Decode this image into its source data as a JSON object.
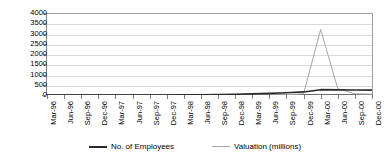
{
  "chart_data": {
    "type": "line",
    "title": "",
    "xlabel": "",
    "ylabel": "",
    "ylim": [
      0,
      4000
    ],
    "ytick_step": 500,
    "yticks": [
      "0",
      "500",
      "1000",
      "1500",
      "2000",
      "2500",
      "3000",
      "3500",
      "4000"
    ],
    "grid": true,
    "legend_position": "bottom",
    "categories": [
      "Mar-96",
      "Jun-96",
      "Sep-96",
      "Dec-96",
      "Mar-97",
      "Jun-97",
      "Sep-97",
      "Dec-97",
      "Mar-98",
      "Jun-98",
      "Sep-98",
      "Dec-98",
      "Mar-99",
      "Jun-99",
      "Sep-99",
      "Dec-99",
      "Mar-00",
      "Jun-00",
      "Sep-00",
      "Dec-00"
    ],
    "series": [
      {
        "name": "No. of Employees",
        "color": "#2b2b2b",
        "values": [
          0,
          0,
          0,
          0,
          0,
          0,
          0,
          0,
          5,
          10,
          20,
          35,
          55,
          80,
          110,
          150,
          260,
          250,
          245,
          240
        ]
      },
      {
        "name": "Valuation (millions)",
        "color": "#a6a6a6",
        "values": [
          0,
          0,
          0,
          0,
          0,
          0,
          0,
          0,
          0,
          0,
          0,
          0,
          0,
          0,
          10,
          60,
          3200,
          300,
          60,
          40
        ]
      }
    ]
  },
  "legend": {
    "items": [
      {
        "label": "No. of Employees"
      },
      {
        "label": "Valuation (millions)"
      }
    ]
  }
}
